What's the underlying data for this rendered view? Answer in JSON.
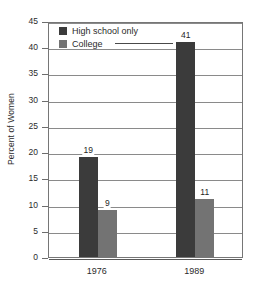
{
  "chart_data": {
    "type": "bar",
    "title": "",
    "xlabel": "",
    "ylabel": "Percent of Women",
    "categories": [
      "1976",
      "1989"
    ],
    "series": [
      {
        "name": "High school only",
        "color": "#3b3b3b",
        "values": [
          19,
          41
        ]
      },
      {
        "name": "College",
        "color": "#737373",
        "values": [
          9,
          11
        ]
      }
    ],
    "ylim": [
      0,
      45
    ],
    "ytick_step": 5,
    "yticks": [
      0,
      5,
      10,
      15,
      20,
      25,
      30,
      35,
      40,
      45
    ],
    "ytick_labels": [
      "0",
      "5",
      "10",
      "15",
      "20",
      "25",
      "30",
      "35",
      "40",
      "45"
    ],
    "grid": true,
    "grid_axis": "y",
    "legend_position": "inside-top-left",
    "data_labels": [
      "19",
      "9",
      "41",
      "11"
    ]
  }
}
